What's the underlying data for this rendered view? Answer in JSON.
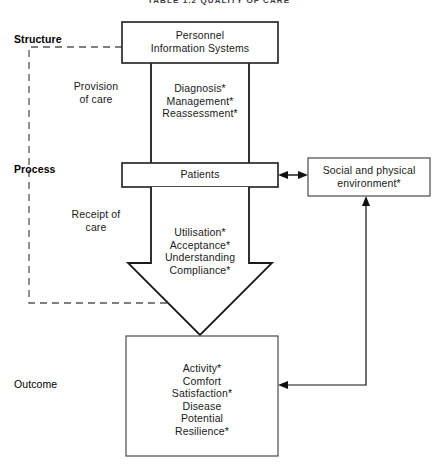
{
  "figure": {
    "title": "TABLE 1.2  QUALITY OF CARE",
    "tier_labels": [
      {
        "name": "structure",
        "text": "Structure"
      },
      {
        "name": "process",
        "text": "Process"
      },
      {
        "name": "outcome",
        "text": "Outcome"
      }
    ],
    "boxes": {
      "personnel": {
        "lines": [
          "Personnel",
          "Information Systems"
        ]
      },
      "patients": {
        "lines": [
          "Patients"
        ]
      },
      "environment": {
        "lines": [
          "Social and physical",
          "environment*"
        ]
      },
      "outcome": {
        "lines": [
          "Activity*",
          "Comfort",
          "Satisfaction*",
          "Disease",
          "Potential",
          "Resilience*"
        ]
      }
    },
    "flow_labels": {
      "provision": {
        "lines": [
          "Provision",
          "of care"
        ]
      },
      "receipt": {
        "lines": [
          "Receipt of",
          "care"
        ]
      },
      "process_items": {
        "lines": [
          "Diagnosis*",
          "Management*",
          "Reassessment*"
        ]
      },
      "receipt_items": {
        "lines": [
          "Utilisation*",
          "Acceptance*",
          "Understanding",
          "Compliance*"
        ]
      }
    },
    "colors": {
      "stroke": "#1a1a1a",
      "box_stroke": "#2b2b2b",
      "dashed_stroke": "#555555",
      "background": "#ffffff",
      "text": "#1a1a1a"
    }
  }
}
